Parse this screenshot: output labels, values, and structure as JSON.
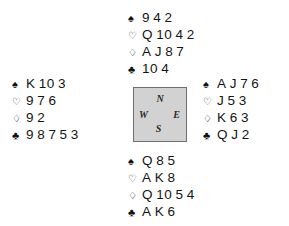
{
  "diagram": {
    "type": "bridge-deal-diagram",
    "suits": [
      {
        "key": "spades",
        "symbol": "♠",
        "filled": true
      },
      {
        "key": "hearts",
        "symbol": "♡",
        "filled": false
      },
      {
        "key": "diamonds",
        "symbol": "♢",
        "filled": false
      },
      {
        "key": "clubs",
        "symbol": "♣",
        "filled": true
      }
    ],
    "compass": {
      "north": "N",
      "east": "E",
      "south": "S",
      "west": "W",
      "fill_color": "#d2d2d2",
      "border_color": "#6f6f6f"
    },
    "hands": {
      "north": {
        "position_label": "N",
        "spades": [
          "9",
          "4",
          "2"
        ],
        "hearts": [
          "Q",
          "10",
          "4",
          "2"
        ],
        "diamonds": [
          "A",
          "J",
          "8",
          "7"
        ],
        "clubs": [
          "10",
          "4"
        ]
      },
      "west": {
        "position_label": "W",
        "spades": [
          "K",
          "10",
          "3"
        ],
        "hearts": [
          "9",
          "7",
          "6"
        ],
        "diamonds": [
          "9",
          "2"
        ],
        "clubs": [
          "9",
          "8",
          "7",
          "5",
          "3"
        ]
      },
      "east": {
        "position_label": "E",
        "spades": [
          "A",
          "J",
          "7",
          "6"
        ],
        "hearts": [
          "J",
          "5",
          "3"
        ],
        "diamonds": [
          "K",
          "6",
          "3"
        ],
        "clubs": [
          "Q",
          "J",
          "2"
        ]
      },
      "south": {
        "position_label": "S",
        "spades": [
          "Q",
          "8",
          "5"
        ],
        "hearts": [
          "A",
          "K",
          "8"
        ],
        "diamonds": [
          "Q",
          "10",
          "5",
          "4"
        ],
        "clubs": [
          "A",
          "K",
          "6"
        ]
      }
    }
  }
}
